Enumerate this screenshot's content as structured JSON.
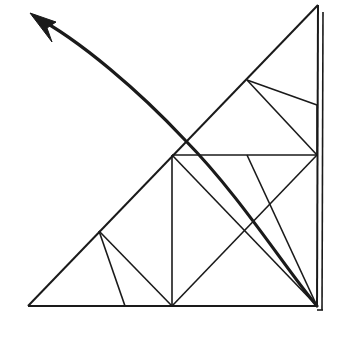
{
  "figure": {
    "background_color": "#ffffff",
    "stroke_color": "#1a1a1a",
    "canvas": {
      "width": 340,
      "height": 338
    },
    "thin_stroke_width": 1.6,
    "medium_stroke_width": 2.0,
    "arrow_stroke_width": 3.2,
    "vertices": {
      "bottom_left": [
        28,
        306
      ],
      "bottom_right": [
        317,
        306
      ],
      "apex_top": [
        318,
        5
      ],
      "hyp_mid": [
        172,
        155
      ],
      "hyp_low": [
        99,
        231
      ],
      "hyp_high": [
        247,
        80
      ],
      "right_edge_upper": [
        317,
        105
      ],
      "bottom_mid_small": [
        125,
        306
      ],
      "square_center_cross_a": [
        247,
        231
      ],
      "square_center_cross_b": [
        265,
        213
      ],
      "arrow_tip": [
        30,
        13
      ],
      "arrow_tail": [
        317,
        306
      ]
    },
    "segments": [
      {
        "name": "triangle-base",
        "from": [
          28,
          306
        ],
        "to": [
          317,
          306
        ],
        "weight": "medium"
      },
      {
        "name": "triangle-right-edge",
        "from": [
          317,
          306
        ],
        "to": [
          318,
          5
        ],
        "weight": "medium"
      },
      {
        "name": "triangle-right-edge-shadow",
        "from": [
          322,
          310
        ],
        "to": [
          323,
          12
        ],
        "weight": "thin"
      },
      {
        "name": "triangle-base-shadow",
        "from": [
          317,
          310
        ],
        "to": [
          323,
          310
        ],
        "weight": "thin"
      },
      {
        "name": "triangle-hypotenuse",
        "from": [
          28,
          306
        ],
        "to": [
          318,
          5
        ],
        "weight": "medium"
      },
      {
        "name": "midline-horizontal",
        "from": [
          172,
          155
        ],
        "to": [
          317,
          155
        ],
        "weight": "thin"
      },
      {
        "name": "midline-vertical",
        "from": [
          172,
          155
        ],
        "to": [
          172,
          306
        ],
        "weight": "thin"
      },
      {
        "name": "square-diagonal-main",
        "from": [
          172,
          155
        ],
        "to": [
          317,
          306
        ],
        "weight": "thin"
      },
      {
        "name": "square-diagonal-counter",
        "from": [
          317,
          155
        ],
        "to": [
          172,
          306
        ],
        "weight": "thin"
      },
      {
        "name": "square-spoke-to-corner",
        "from": [
          317,
          105
        ],
        "to": [
          317,
          155
        ],
        "weight": "thin"
      },
      {
        "name": "upper-fan-a",
        "from": [
          247,
          80
        ],
        "to": [
          317,
          105
        ],
        "weight": "thin"
      },
      {
        "name": "upper-fan-b",
        "from": [
          247,
          80
        ],
        "to": [
          317,
          155
        ],
        "weight": "thin"
      },
      {
        "name": "lower-fan-a",
        "from": [
          99,
          231
        ],
        "to": [
          125,
          306
        ],
        "weight": "thin"
      },
      {
        "name": "lower-fan-b",
        "from": [
          99,
          231
        ],
        "to": [
          172,
          306
        ],
        "weight": "thin"
      },
      {
        "name": "corner-spoke",
        "from": [
          317,
          306
        ],
        "to": [
          247,
          155
        ],
        "weight": "thin"
      }
    ],
    "arrow": {
      "name": "curved-arrow",
      "path": "M 317 306 C 285 268, 240 196, 185 140 C 140 92, 80 40, 34 16",
      "head_points": "30,13 56,22 47,28 52,42",
      "direction": "up-left"
    }
  }
}
